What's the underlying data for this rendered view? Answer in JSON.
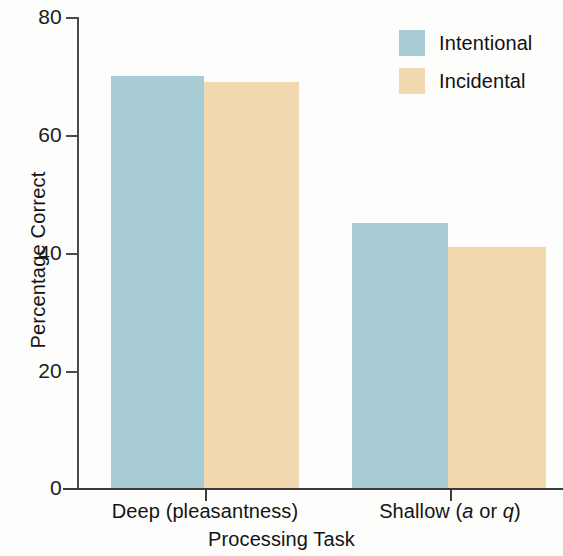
{
  "chart_data": {
    "type": "bar",
    "title": "",
    "xlabel": "Processing Task",
    "ylabel": "Percentage Correct",
    "categories": [
      "Deep (pleasantness)",
      "Shallow (a or q)"
    ],
    "series": [
      {
        "name": "Intentional",
        "color": "#a7ccd5",
        "values": [
          70,
          45
        ]
      },
      {
        "name": "Incidental",
        "color": "#f2d9b0",
        "values": [
          69,
          41
        ]
      }
    ],
    "ylim": [
      0,
      80
    ],
    "yticks": [
      0,
      20,
      40,
      60,
      80
    ],
    "ytick_labels": [
      "0",
      "20",
      "40",
      "60",
      "80"
    ],
    "grid": false,
    "legend_position": "top-right"
  },
  "axes": {
    "y_title": "Percentage Correct",
    "x_title": "Processing Task",
    "y_ticks": [
      {
        "label": "80",
        "value": 80
      },
      {
        "label": "60",
        "value": 60
      },
      {
        "label": "40",
        "value": 40
      },
      {
        "label": "20",
        "value": 20
      },
      {
        "label": "0",
        "value": 0
      }
    ]
  },
  "groups": [
    {
      "label_plain": "Deep (pleasantness)",
      "label_pre": "Deep (pleasantness)",
      "label_italic": "",
      "label_mid": "",
      "label_italic2": "",
      "label_post": ""
    },
    {
      "label_plain": "Shallow (a or q)",
      "label_pre": "Shallow (",
      "label_italic": "a",
      "label_mid": " or ",
      "label_italic2": "q",
      "label_post": ")"
    }
  ],
  "legend": {
    "items": [
      {
        "label": "Intentional",
        "color": "#a7ccd5"
      },
      {
        "label": "Incidental",
        "color": "#f2d9b0"
      }
    ]
  },
  "colors": {
    "intentional": "#a7ccd5",
    "incidental": "#f2d9b0",
    "axis": "#3c3c3c",
    "text": "#141414",
    "background": "#fdfdfc"
  }
}
